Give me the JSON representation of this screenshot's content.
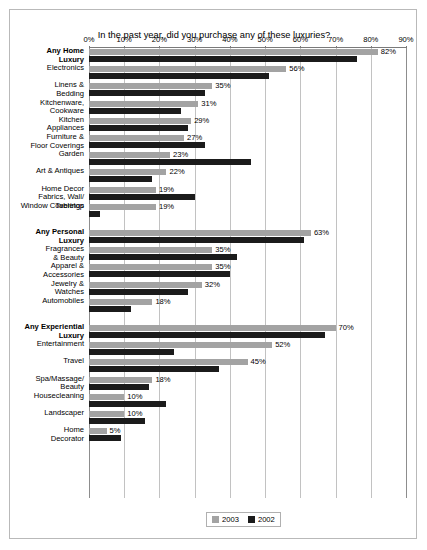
{
  "chart_data": {
    "type": "bar",
    "orientation": "horizontal",
    "title": "In the past year, did you purchase any of these luxuries?",
    "xlabel": "",
    "ylabel": "",
    "xlim": [
      0,
      90
    ],
    "xtick_labels": [
      "0%",
      "10%",
      "20%",
      "30%",
      "40%",
      "50%",
      "60%",
      "70%",
      "80%",
      "90%"
    ],
    "xticks": [
      0,
      10,
      20,
      30,
      40,
      50,
      60,
      70,
      80,
      90
    ],
    "grid": true,
    "legend_position": "bottom-center",
    "legend": [
      "2003",
      "2002"
    ],
    "series": [
      {
        "name": "2003",
        "color": "#a3a3a3",
        "values": [
          82,
          56,
          35,
          31,
          29,
          27,
          23,
          22,
          19,
          19,
          63,
          35,
          35,
          32,
          18,
          70,
          52,
          45,
          18,
          10,
          10,
          5
        ]
      },
      {
        "name": "2002",
        "color": "#1b1b1b",
        "values": [
          76,
          51,
          33,
          26,
          28,
          33,
          46,
          18,
          30,
          3,
          61,
          42,
          40,
          28,
          12,
          67,
          24,
          37,
          17,
          22,
          16,
          9
        ]
      }
    ],
    "categories": [
      "Any Home\nLuxury",
      "Electronics",
      "Linens &\nBedding",
      "Kitchenware,\nCookware",
      "Kitchen\nAppliances",
      "Furniture &\nFloor Coverings",
      "Garden",
      "Art & Antiques",
      "Home Decor\nFabrics, Wall/\nWindow Coverings",
      "Tabletop",
      "Any Personal\nLuxury",
      "Fragrances\n& Beauty",
      "Apparel &\nAccessories",
      "Jewelry &\nWatches",
      "Automobiles",
      "Any Experiential\nLuxury",
      "Entertainment",
      "Travel",
      "Spa/Massage/\nBeauty",
      "Housecleaning",
      "Landscaper",
      "Home\nDecorator"
    ],
    "value_labels": [
      "82%",
      "56%",
      "35%",
      "31%",
      "29%",
      "27%",
      "23%",
      "22%",
      "19%",
      "19%",
      "63%",
      "35%",
      "35%",
      "32%",
      "18%",
      "70%",
      "52%",
      "45%",
      "18%",
      "10%",
      "10%",
      "5%"
    ],
    "groups": [
      {
        "header": "Any Home Luxury",
        "header_index": 0,
        "member_indices": [
          1,
          2,
          3,
          4,
          5,
          6,
          7,
          8,
          9
        ]
      },
      {
        "header": "Any Personal Luxury",
        "header_index": 10,
        "member_indices": [
          11,
          12,
          13,
          14
        ]
      },
      {
        "header": "Any Experiential Luxury",
        "header_index": 15,
        "member_indices": [
          16,
          17,
          18,
          19,
          20,
          21
        ]
      }
    ],
    "is_group_header": [
      true,
      false,
      false,
      false,
      false,
      false,
      false,
      false,
      false,
      false,
      true,
      false,
      false,
      false,
      false,
      true,
      false,
      false,
      false,
      false,
      false,
      false
    ],
    "colors": {
      "series_2003": "#a3a3a3",
      "series_2002": "#1b1b1b",
      "gridline": "#c2c2c2",
      "axis": "#7a7a7a",
      "frame": "#b9b9b9",
      "background": "#ffffff"
    }
  }
}
